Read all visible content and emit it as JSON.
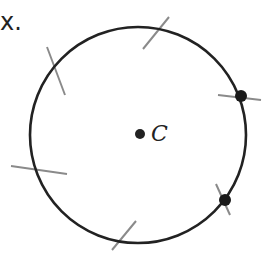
{
  "header": {
    "label": "x."
  },
  "diagram": {
    "center_label": "C",
    "circle": {
      "cx": 138,
      "cy": 135,
      "r": 108,
      "stroke": "#222222"
    },
    "arc_mark_color": "#8a8a8a",
    "arc_marks": [
      {
        "name": "top",
        "x1": 143,
        "y1": 49,
        "x2": 169,
        "y2": 17
      },
      {
        "name": "upper-left",
        "x1": 47,
        "y1": 47,
        "x2": 65,
        "y2": 95
      },
      {
        "name": "lower-left",
        "x1": 11,
        "y1": 166,
        "x2": 67,
        "y2": 174
      },
      {
        "name": "bottom",
        "x1": 112,
        "y1": 250,
        "x2": 136,
        "y2": 221
      },
      {
        "name": "right-upper",
        "x1": 218,
        "y1": 95,
        "x2": 261,
        "y2": 100
      },
      {
        "name": "right-lower",
        "x1": 216,
        "y1": 184,
        "x2": 230,
        "y2": 215
      }
    ],
    "points": [
      {
        "name": "right-upper-point",
        "cx": 241,
        "cy": 96,
        "r": 6
      },
      {
        "name": "right-lower-point",
        "cx": 225,
        "cy": 200,
        "r": 6
      }
    ],
    "center_point": {
      "cx": 140,
      "cy": 134,
      "r": 5
    }
  }
}
